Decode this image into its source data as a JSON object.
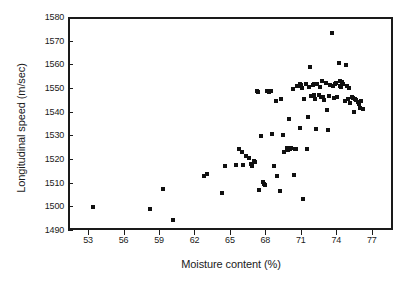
{
  "chart_data": {
    "type": "scatter",
    "title": "",
    "xlabel": "Moisture content (%)",
    "ylabel": "Longitudinal speed (m/sec)",
    "xlim": [
      51.3,
      78.8
    ],
    "ylim": [
      1490,
      1580
    ],
    "xticks": [
      53,
      56,
      59,
      62,
      65,
      68,
      71,
      74,
      77
    ],
    "yticks": [
      1490,
      1500,
      1510,
      1520,
      1530,
      1540,
      1550,
      1560,
      1570,
      1580
    ],
    "xtick_labels": [
      "53",
      "56",
      "59",
      "62",
      "65",
      "68",
      "71",
      "74",
      "77"
    ],
    "ytick_labels": [
      "1490",
      "1500",
      "1510",
      "1520",
      "1530",
      "1540",
      "1550",
      "1560",
      "1570",
      "1580"
    ],
    "grid": false,
    "legend": null,
    "marker": "square",
    "marker_color": "#101010",
    "marker_size_px": 4,
    "n_points": 104,
    "points": [
      [
        53.4,
        1499.8
      ],
      [
        58.2,
        1499.0
      ],
      [
        59.3,
        1507.2
      ],
      [
        60.2,
        1494.3
      ],
      [
        62.8,
        1512.8
      ],
      [
        63.1,
        1513.8
      ],
      [
        64.3,
        1505.6
      ],
      [
        64.6,
        1517.2
      ],
      [
        65.5,
        1517.5
      ],
      [
        65.8,
        1524.4
      ],
      [
        66.0,
        1522.8
      ],
      [
        66.1,
        1517.6
      ],
      [
        66.4,
        1521.3
      ],
      [
        66.6,
        1520.6
      ],
      [
        66.8,
        1517.8
      ],
      [
        66.9,
        1516.9
      ],
      [
        67.0,
        1519.2
      ],
      [
        67.1,
        1518.6
      ],
      [
        67.3,
        1548.8
      ],
      [
        67.4,
        1548.5
      ],
      [
        67.5,
        1507.0
      ],
      [
        67.6,
        1529.6
      ],
      [
        67.8,
        1510.4
      ],
      [
        67.9,
        1509.6
      ],
      [
        68.0,
        1509.2
      ],
      [
        68.1,
        1548.6
      ],
      [
        68.3,
        1548.3
      ],
      [
        68.5,
        1548.8
      ],
      [
        68.6,
        1530.4
      ],
      [
        68.7,
        1516.9
      ],
      [
        68.9,
        1544.4
      ],
      [
        69.0,
        1513.0
      ],
      [
        69.2,
        1506.3
      ],
      [
        69.3,
        1545.2
      ],
      [
        69.5,
        1530.1
      ],
      [
        69.6,
        1522.8
      ],
      [
        69.8,
        1524.6
      ],
      [
        69.9,
        1524.0
      ],
      [
        70.0,
        1536.9
      ],
      [
        70.1,
        1524.3
      ],
      [
        70.2,
        1524.5
      ],
      [
        70.3,
        1549.7
      ],
      [
        70.4,
        1513.1
      ],
      [
        70.5,
        1524.2
      ],
      [
        70.6,
        1524.3
      ],
      [
        70.7,
        1550.8
      ],
      [
        70.8,
        1551.0
      ],
      [
        70.9,
        1533.0
      ],
      [
        71.0,
        1551.3
      ],
      [
        71.1,
        1550.2
      ],
      [
        71.2,
        1502.9
      ],
      [
        71.3,
        1545.4
      ],
      [
        71.4,
        1551.5
      ],
      [
        71.5,
        1524.2
      ],
      [
        71.6,
        1537.9
      ],
      [
        71.7,
        1550.5
      ],
      [
        71.8,
        1558.8
      ],
      [
        71.9,
        1546.6
      ],
      [
        72.0,
        1551.2
      ],
      [
        72.1,
        1546.9
      ],
      [
        72.2,
        1545.4
      ],
      [
        72.3,
        1532.6
      ],
      [
        72.4,
        1551.8
      ],
      [
        72.5,
        1547.0
      ],
      [
        72.6,
        1550.6
      ],
      [
        72.7,
        1546.4
      ],
      [
        72.8,
        1553.0
      ],
      [
        72.9,
        1546.0
      ],
      [
        73.0,
        1544.8
      ],
      [
        73.1,
        1552.2
      ],
      [
        73.2,
        1540.8
      ],
      [
        73.3,
        1532.1
      ],
      [
        73.4,
        1546.8
      ],
      [
        73.5,
        1551.4
      ],
      [
        73.6,
        1573.2
      ],
      [
        73.7,
        1551.0
      ],
      [
        73.8,
        1545.7
      ],
      [
        73.9,
        1551.8
      ],
      [
        74.0,
        1552.2
      ],
      [
        74.1,
        1546.2
      ],
      [
        74.2,
        1560.4
      ],
      [
        74.3,
        1551.0
      ],
      [
        74.4,
        1550.4
      ],
      [
        74.5,
        1552.4
      ],
      [
        74.6,
        1551.6
      ],
      [
        74.7,
        1544.3
      ],
      [
        74.8,
        1559.6
      ],
      [
        74.9,
        1551.0
      ],
      [
        75.0,
        1545.2
      ],
      [
        75.1,
        1550.0
      ],
      [
        75.2,
        1543.8
      ],
      [
        75.3,
        1546.2
      ],
      [
        75.4,
        1545.6
      ],
      [
        75.5,
        1540.0
      ],
      [
        75.6,
        1545.4
      ],
      [
        75.7,
        1544.9
      ],
      [
        75.8,
        1544.2
      ],
      [
        75.9,
        1543.4
      ],
      [
        76.0,
        1541.6
      ],
      [
        76.1,
        1544.6
      ],
      [
        76.3,
        1541.0
      ],
      [
        70.9,
        1551.6
      ],
      [
        72.1,
        1551.6
      ],
      [
        74.3,
        1552.8
      ]
    ]
  }
}
